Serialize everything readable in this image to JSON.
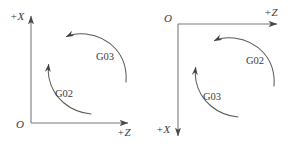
{
  "figure": {
    "background_color": "#ffffff",
    "stroke_color": "#555555",
    "text_color": "#3a3a3a",
    "diagrams": [
      {
        "name": "front-tool-post-coordinate-system",
        "origin_label": "O",
        "vertical_axis_label": "+X",
        "vertical_axis_direction": "up",
        "horizontal_axis_label": "+Z",
        "horizontal_axis_direction": "right",
        "arcs": [
          {
            "label": "G03",
            "direction": "counterclockwise",
            "position": "outer-upper"
          },
          {
            "label": "G02",
            "direction": "clockwise",
            "position": "inner-lower"
          }
        ]
      },
      {
        "name": "rear-tool-post-coordinate-system",
        "origin_label": "O",
        "vertical_axis_label": "+X",
        "vertical_axis_direction": "down",
        "horizontal_axis_label": "+Z",
        "horizontal_axis_direction": "right",
        "arcs": [
          {
            "label": "G02",
            "direction": "counterclockwise",
            "position": "outer-upper"
          },
          {
            "label": "G03",
            "direction": "clockwise",
            "position": "inner-lower"
          }
        ]
      }
    ]
  }
}
